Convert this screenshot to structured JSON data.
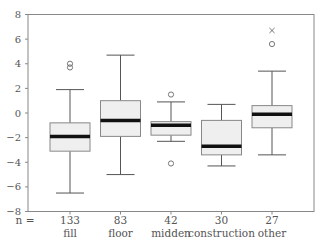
{
  "chart_data": {
    "type": "boxplot",
    "title": "",
    "xlabel": "",
    "ylabel": "",
    "ylim": [
      -8,
      8
    ],
    "yticks": [
      -8,
      -6,
      -4,
      -2,
      0,
      2,
      4,
      6,
      8
    ],
    "ytick_labels": [
      "−8",
      "−6",
      "−4",
      "−2",
      "0",
      "2",
      "4",
      "6",
      "8"
    ],
    "n_prefix": "n =",
    "categories": [
      "fill",
      "floor",
      "midden",
      "construction",
      "other"
    ],
    "counts": [
      "133",
      "83",
      "42",
      "30",
      "27"
    ],
    "boxes": [
      {
        "name": "fill",
        "whisker_low": -6.5,
        "q1": -3.1,
        "median": -1.9,
        "q3": -0.8,
        "whisker_high": 1.9,
        "outliers": [
          3.7,
          4.0
        ],
        "extremes": []
      },
      {
        "name": "floor",
        "whisker_low": -5.0,
        "q1": -1.9,
        "median": -0.6,
        "q3": 1.0,
        "whisker_high": 4.7,
        "outliers": [],
        "extremes": []
      },
      {
        "name": "midden",
        "whisker_low": -2.3,
        "q1": -1.8,
        "median": -1.0,
        "q3": -0.7,
        "whisker_high": 0.9,
        "outliers": [
          1.5,
          -4.1
        ],
        "extremes": []
      },
      {
        "name": "construction",
        "whisker_low": -4.3,
        "q1": -3.4,
        "median": -2.7,
        "q3": -0.6,
        "whisker_high": 0.7,
        "outliers": [],
        "extremes": []
      },
      {
        "name": "other",
        "whisker_low": -3.4,
        "q1": -1.2,
        "median": -0.1,
        "q3": 0.6,
        "whisker_high": 3.4,
        "outliers": [
          5.6
        ],
        "extremes": [
          6.7
        ]
      }
    ],
    "grid": false,
    "legend": "none"
  }
}
